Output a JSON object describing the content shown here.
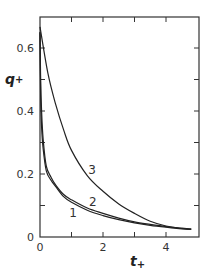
{
  "chart_data": {
    "type": "line",
    "title": "",
    "xlabel": "t+",
    "ylabel": "q+",
    "xlim": [
      0,
      5
    ],
    "ylim": [
      0,
      0.67
    ],
    "grid": false,
    "legend": "inline curve labels",
    "x_ticks": [
      0,
      1,
      2,
      3,
      4
    ],
    "x_tick_labels": [
      "0",
      "",
      "2",
      "",
      "4"
    ],
    "y_ticks": [
      0,
      0.1,
      0.2,
      0.3,
      0.4,
      0.5,
      0.6
    ],
    "y_tick_labels": [
      "0",
      "",
      "0.2",
      "",
      "0.4",
      "",
      "0.6"
    ],
    "series": [
      {
        "name": "1",
        "x": [
          0,
          0.02,
          0.05,
          0.1,
          0.2,
          0.35,
          0.5,
          0.75,
          1.0,
          1.5,
          2.0,
          2.5,
          3.0,
          3.5,
          4.0,
          4.5,
          4.8
        ],
        "values": [
          0.65,
          0.45,
          0.35,
          0.28,
          0.21,
          0.18,
          0.16,
          0.128,
          0.11,
          0.085,
          0.068,
          0.055,
          0.045,
          0.037,
          0.031,
          0.026,
          0.024
        ],
        "label_pos": {
          "t": 1.05,
          "q": 0.08
        }
      },
      {
        "name": "2",
        "x": [
          0,
          0.02,
          0.05,
          0.1,
          0.2,
          0.35,
          0.5,
          0.75,
          1.0,
          1.5,
          2.0,
          2.5,
          3.0,
          3.5,
          4.0,
          4.5,
          4.8
        ],
        "values": [
          0.65,
          0.5,
          0.4,
          0.31,
          0.225,
          0.19,
          0.165,
          0.135,
          0.118,
          0.092,
          0.075,
          0.06,
          0.048,
          0.04,
          0.033,
          0.028,
          0.025
        ],
        "label_pos": {
          "t": 1.68,
          "q": 0.115
        }
      },
      {
        "name": "3",
        "x": [
          0,
          0.25,
          0.5,
          0.75,
          1.0,
          1.5,
          2.0,
          2.5,
          3.0,
          3.5,
          4.0,
          4.5,
          4.8
        ],
        "values": [
          0.667,
          0.52,
          0.42,
          0.34,
          0.275,
          0.195,
          0.145,
          0.105,
          0.075,
          0.05,
          0.035,
          0.027,
          0.025
        ],
        "label_pos": {
          "t": 1.65,
          "q": 0.215
        }
      }
    ]
  },
  "axes": {
    "x_title_main": "t",
    "x_title_sub": "+",
    "y_title_main": "q",
    "y_title_sub": "+"
  }
}
